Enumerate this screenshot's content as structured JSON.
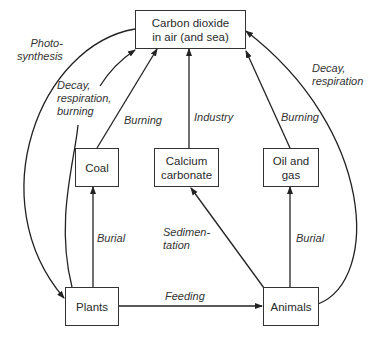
{
  "diagram": {
    "nodes": {
      "co2": {
        "label": "Carbon dioxide\nin air (and sea)"
      },
      "coal": {
        "label": "Coal"
      },
      "calcium": {
        "label": "Calcium\ncarbonate"
      },
      "oil": {
        "label": "Oil and\ngas"
      },
      "plants": {
        "label": "Plants"
      },
      "animals": {
        "label": "Animals"
      }
    },
    "edges": {
      "photosynthesis": {
        "label": "Photo-\nsynthesis",
        "from": "co2",
        "to": "plants"
      },
      "plants_decay": {
        "label": "Decay,\nrespiration,\nburning",
        "from": "plants",
        "to": "co2"
      },
      "coal_burning": {
        "label": "Burning",
        "from": "coal",
        "to": "co2"
      },
      "industry": {
        "label": "Industry",
        "from": "calcium",
        "to": "co2"
      },
      "oil_burning": {
        "label": "Burning",
        "from": "oil",
        "to": "co2"
      },
      "animals_decay": {
        "label": "Decay,\nrespiration",
        "from": "animals",
        "to": "co2"
      },
      "plants_burial": {
        "label": "Burial",
        "from": "plants",
        "to": "coal"
      },
      "sedimentation": {
        "label": "Sedimen-\ntation",
        "from": "animals",
        "to": "calcium"
      },
      "animals_burial": {
        "label": "Burial",
        "from": "animals",
        "to": "oil"
      },
      "feeding": {
        "label": "Feeding",
        "from": "plants",
        "to": "animals"
      }
    }
  }
}
